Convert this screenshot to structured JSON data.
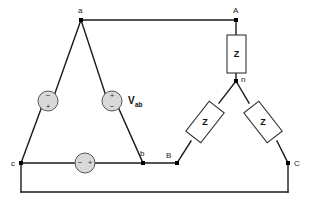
{
  "diagram": {
    "colors": {
      "background": "#ffffff",
      "wire": "#1a1a1a",
      "source_fill": "#d9d9d9",
      "source_stroke": "#555555",
      "impedance_stroke": "#333333",
      "impedance_fill": "#ffffff",
      "text": "#111111"
    },
    "nodes": [
      {
        "id": "a",
        "label": "a",
        "x": 81,
        "y": 20,
        "label_x": 78,
        "label_y": 13
      },
      {
        "id": "b",
        "label": "b",
        "x": 143,
        "y": 163,
        "label_x": 140,
        "label_y": 156
      },
      {
        "id": "c",
        "label": "c",
        "x": 21,
        "y": 163,
        "label_x": 11,
        "label_y": 166
      },
      {
        "id": "A",
        "label": "A",
        "x": 236,
        "y": 20,
        "label_x": 233,
        "label_y": 13
      },
      {
        "id": "B",
        "label": "B",
        "x": 177,
        "y": 163,
        "label_x": 166,
        "label_y": 158
      },
      {
        "id": "C",
        "label": "C",
        "x": 288,
        "y": 163,
        "label_x": 294,
        "label_y": 166
      },
      {
        "id": "n",
        "label": "n",
        "x": 236,
        "y": 81,
        "label_x": 241,
        "label_y": 82
      }
    ],
    "sources": [
      {
        "id": "source-ca",
        "name": "source-ca",
        "cx": 48,
        "cy": 101,
        "r": 10,
        "orientation": "diagonal",
        "top_sign": "−",
        "bottom_sign": "+",
        "top_sign_x": 48,
        "top_sign_y": 96,
        "bottom_sign_x": 48,
        "bottom_sign_y": 107
      },
      {
        "id": "source-ab",
        "name": "source-ab",
        "cx": 112,
        "cy": 101,
        "r": 10,
        "orientation": "diagonal",
        "top_sign": "+",
        "bottom_sign": "−",
        "top_sign_x": 112,
        "top_sign_y": 96,
        "bottom_sign_x": 112,
        "bottom_sign_y": 107
      },
      {
        "id": "source-bc",
        "name": "source-bc",
        "cx": 85,
        "cy": 163,
        "r": 10,
        "orientation": "horizontal",
        "left_sign": "−",
        "right_sign": "+",
        "left_sign_x": 80,
        "left_sign_y": 163,
        "right_sign_x": 90,
        "right_sign_y": 163
      }
    ],
    "impedances": [
      {
        "id": "z-phase-A",
        "name": "impedance-phase-a",
        "label": "Z",
        "shape": "vertical",
        "x": 227,
        "y": 35,
        "w": 19,
        "h": 38,
        "label_x": 236.5,
        "label_y": 57,
        "rotation": 0
      },
      {
        "id": "z-phase-B",
        "name": "impedance-phase-b",
        "label": "Z",
        "shape": "rotated",
        "cx": 205,
        "cy": 122,
        "w": 19,
        "h": 38,
        "rotation": 38,
        "label_x": 205,
        "label_y": 125
      },
      {
        "id": "z-phase-C",
        "name": "impedance-phase-c",
        "label": "Z",
        "shape": "rotated",
        "cx": 263,
        "cy": 122,
        "w": 19,
        "h": 38,
        "rotation": -38,
        "label_x": 263,
        "label_y": 125
      }
    ],
    "voltage_labels": [
      {
        "id": "v-ab",
        "name": "voltage-label-vab",
        "symbol": "V",
        "subscript": "ab",
        "x": 128,
        "y": 104
      }
    ],
    "wires": [
      {
        "id": "wire-a-to-A",
        "name": "wire-a-to-A",
        "points": "81,20 236,20"
      },
      {
        "id": "wire-A-to-Z",
        "name": "wire-A-to-z",
        "points": "236,20 236,35"
      },
      {
        "id": "wire-Z-to-n",
        "name": "wire-z-to-n",
        "points": "236,73 236,81"
      },
      {
        "id": "wire-n-to-zb",
        "name": "wire-n-to-zb",
        "points": "236,81 219,103"
      },
      {
        "id": "wire-zb-to-B",
        "name": "wire-zb-to-B",
        "points": "191,141 177,163"
      },
      {
        "id": "wire-n-to-zc",
        "name": "wire-n-to-zc",
        "points": "236,81 249,103"
      },
      {
        "id": "wire-zc-to-C",
        "name": "wire-zc-to-C",
        "points": "277,141 288,163"
      },
      {
        "id": "wire-b-to-B",
        "name": "wire-b-to-B",
        "points": "143,163 177,163"
      },
      {
        "id": "wire-a-to-srcab",
        "name": "wire-a-to-source-ab",
        "points": "81,20 105,93"
      },
      {
        "id": "wire-srcab-to-b",
        "name": "wire-source-ab-to-b",
        "points": "119,109 143,163"
      },
      {
        "id": "wire-a-to-srcca",
        "name": "wire-a-to-source-ca",
        "points": "81,20 55,93"
      },
      {
        "id": "wire-srcca-to-c",
        "name": "wire-source-ca-to-c",
        "points": "41,109 21,163"
      },
      {
        "id": "wire-c-to-srcbc",
        "name": "wire-c-to-source-bc",
        "points": "21,163 75,163"
      },
      {
        "id": "wire-srcbc-to-b",
        "name": "wire-source-bc-to-b",
        "points": "95,163 143,163"
      },
      {
        "id": "wire-c-down",
        "name": "wire-c-down",
        "points": "21,163 21,192"
      },
      {
        "id": "wire-bottom",
        "name": "wire-bottom-return",
        "points": "21,192 288,192"
      },
      {
        "id": "wire-C-down",
        "name": "wire-C-down",
        "points": "288,163 288,192"
      }
    ]
  }
}
